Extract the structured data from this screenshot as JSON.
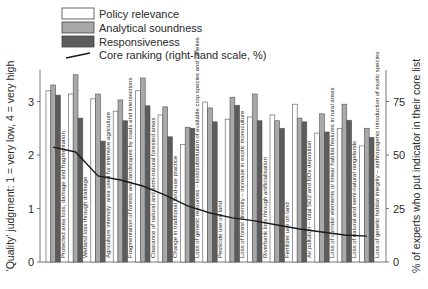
{
  "chart_data": {
    "type": "bar",
    "title": "",
    "legend": {
      "placement": "top-left",
      "entries": [
        {
          "name": "Policy relevance",
          "kind": "bar",
          "color": "#ffffff"
        },
        {
          "name": "Analytical soundness",
          "kind": "bar",
          "color": "#a9a9a9"
        },
        {
          "name": "Responsiveness",
          "kind": "bar",
          "color": "#5c5c5c"
        },
        {
          "name": "Core ranking (right-hand scale, %)",
          "kind": "line",
          "color": "#1a1a1a"
        }
      ]
    },
    "ylabel": "'Quality' judgment:  1 = very low,  4 = very high",
    "ylabel_right": "% of experts who put indicator in their core list",
    "ylim": [
      0,
      3.6
    ],
    "yticks": [
      "0",
      "1",
      "2",
      "3"
    ],
    "ylim_right": [
      0,
      90
    ],
    "yticks_right": [
      "0",
      "25",
      "50",
      "75"
    ],
    "grid": false,
    "categories": [
      "Protected area loss, damage and fragmentation",
      "Wetland loss through drainage",
      "Agriculture intensity: area used for intensive agriculture",
      "Fragmentation of forests and landscapes by roads and intersections",
      "Clearance of natural and semi-natural forested areas",
      "Change in traditional land-use practice",
      "Loss of genetic resources – loss/substitution of available crop species and varieties",
      "Pesticide use on land",
      "Loss of forest diversity – increase in exotic monoculture",
      "Riverbank loss through artificialisation",
      "Fertilizer use on land",
      "Air pollution – total SO2 and NOx deposition",
      "Loss of corridor elements or linear habitat features in rural areas",
      "Loss of natural and semi-natural rangelands",
      "Loss of genetic habitat integrity – anthropogenic introduction of exotic species"
    ],
    "series": [
      {
        "name": "Policy relevance",
        "axis": "left",
        "values": [
          3.2,
          3.14,
          3.05,
          2.82,
          3.2,
          2.75,
          2.2,
          2.99,
          2.67,
          2.71,
          2.75,
          2.95,
          2.41,
          2.5,
          2.17
        ]
      },
      {
        "name": "Analytical soundness",
        "axis": "left",
        "values": [
          3.31,
          3.5,
          3.14,
          3.03,
          3.44,
          2.9,
          2.52,
          2.88,
          3.08,
          3.14,
          2.64,
          2.69,
          2.77,
          2.95,
          2.5
        ]
      },
      {
        "name": "Responsiveness",
        "axis": "left",
        "values": [
          3.12,
          2.69,
          2.26,
          2.64,
          2.92,
          2.34,
          2.5,
          2.62,
          2.93,
          2.64,
          2.5,
          2.62,
          2.43,
          2.65,
          2.33
        ]
      },
      {
        "name": "Core ranking (right-hand scale, %)",
        "axis": "right",
        "type": "line",
        "values": [
          53.7,
          51.4,
          40.2,
          38.3,
          35.5,
          31.3,
          26.2,
          22.9,
          20.6,
          19.2,
          17.3,
          15.4,
          14.0,
          12.6,
          12.1
        ]
      }
    ]
  }
}
